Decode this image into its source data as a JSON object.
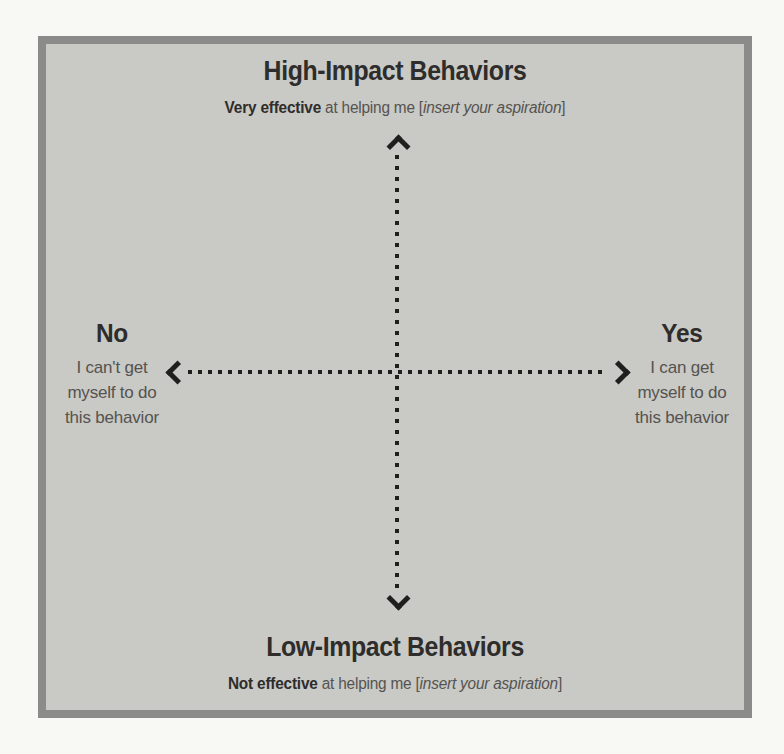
{
  "top": {
    "title": "High-Impact Behaviors",
    "subtitle": {
      "bold": "Very effective",
      "plain": " at helping me [",
      "italic": "insert your aspiration",
      "close": "]"
    }
  },
  "bottom": {
    "title": "Low-Impact Behaviors",
    "subtitle": {
      "bold": "Not effective",
      "plain": " at helping me [",
      "italic": "insert your aspiration",
      "close": "]"
    }
  },
  "left": {
    "title": "No",
    "lines": [
      "I can't get",
      "myself to do",
      "this behavior"
    ]
  },
  "right": {
    "title": "Yes",
    "lines": [
      "I can get",
      "myself to do",
      "this behavior"
    ]
  },
  "icons": {
    "up": "arrow-up-icon",
    "down": "arrow-down-icon",
    "left": "arrow-left-icon",
    "right": "arrow-right-icon"
  },
  "colors": {
    "panel_background": "#c9c9c6",
    "panel_border": "#8b8b89",
    "page_background": "#f8f8f5",
    "axis_and_title_dark": "#1f1f1d",
    "secondary_text": "#55534f"
  }
}
